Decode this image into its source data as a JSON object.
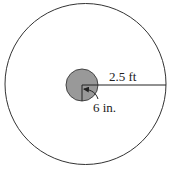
{
  "diagram": {
    "type": "concentric-circles",
    "outer_circle": {
      "radius_label": "2.5 ft",
      "fill": "#ffffff",
      "stroke": "#333333"
    },
    "inner_circle": {
      "radius_label": "6 in.",
      "fill": "#999999",
      "stroke": "#444444"
    }
  }
}
